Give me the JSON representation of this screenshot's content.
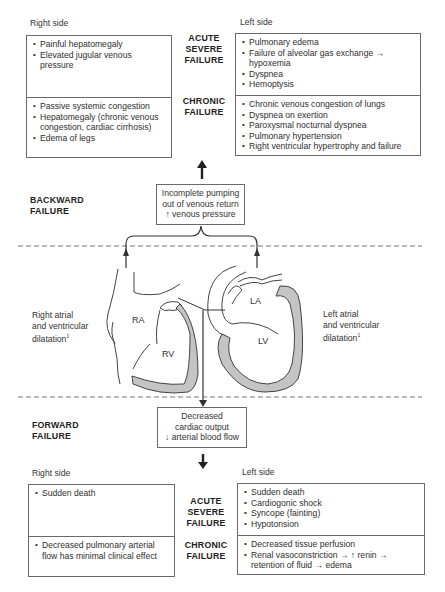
{
  "backward": {
    "section_label_line1": "BACKWARD",
    "section_label_line2": "FAILURE",
    "center_box": [
      "Incomplete pumping",
      "out of venous return",
      "↑ venous pressure"
    ],
    "right_side_label": "Right side",
    "left_side_label": "Left side",
    "acute_label": [
      "ACUTE",
      "SEVERE",
      "FAILURE"
    ],
    "chronic_label": [
      "CHRONIC",
      "FAILURE"
    ],
    "right_acute": [
      "Painful hepatomegaly",
      "Elevated jugular venous pressure"
    ],
    "right_chronic": [
      "Passive systemic congestion",
      "Hepatomegaly (chronic venous congestion, cardiac cirrhosis)",
      "Edema of legs"
    ],
    "left_acute": [
      "Pulmonary edema",
      "Failure of alveolar gas exchange → hypoxemia",
      "Dyspnea",
      "Hemoptysis"
    ],
    "left_chronic": [
      "Chronic venous congestion of lungs",
      "Dyspnea on exertion",
      "Paroxysmal nocturnal dyspnea",
      "Pulmonary hypertension",
      "Right ventricular hypertrophy and failure"
    ]
  },
  "heart": {
    "right_dilatation": [
      "Right atrial",
      "and ventricular",
      "dilatation"
    ],
    "left_dilatation": [
      "Left atrial",
      "and ventricular",
      "dilatation"
    ],
    "footnote_mark": "1",
    "chambers": {
      "ra": "RA",
      "rv": "RV",
      "la": "LA",
      "lv": "LV"
    },
    "wall_color": "#c4c4c4"
  },
  "forward": {
    "section_label_line1": "FORWARD",
    "section_label_line2": "FAILURE",
    "center_box": [
      "Decreased",
      "cardiac output",
      "↓ arterial blood flow"
    ],
    "right_side_label": "Right side",
    "left_side_label": "Left side",
    "acute_label": [
      "ACUTE",
      "SEVERE",
      "FAILURE"
    ],
    "chronic_label": [
      "CHRONIC",
      "FAILURE"
    ],
    "right_acute": [
      "Sudden death"
    ],
    "right_chronic": [
      "Decreased pulmonary arterial flow has minimal clinical effect"
    ],
    "left_acute": [
      "Sudden death",
      "Cardiogonic shock",
      "Syncope (fainting)",
      "Hypotonsion"
    ],
    "left_chronic": [
      "Decreased tissue perfusion",
      "Renal vasoconstriction → ↑ renin → retention of fluid → edema"
    ]
  }
}
